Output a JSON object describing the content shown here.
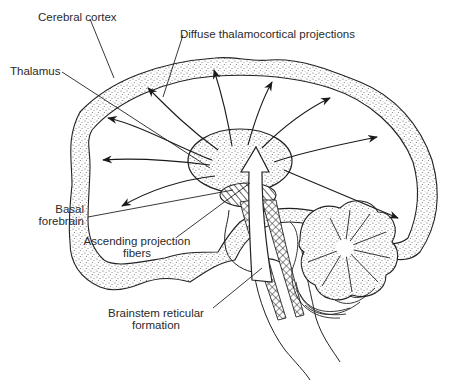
{
  "diagram": {
    "colors": {
      "line": "#1a1a1a",
      "stipple": "#555555",
      "background": "#ffffff",
      "text": "#2a2a2a"
    },
    "labels": {
      "cerebral_cortex": "Cerebral cortex",
      "diffuse_projections": "Diffuse thalamocortical projections",
      "thalamus": "Thalamus",
      "basal_forebrain_1": "Basal",
      "basal_forebrain_2": "forebrain",
      "ascending_fibers_1": "Ascending projection",
      "ascending_fibers_2": "fibers",
      "brainstem_rf_1": "Brainstem reticular",
      "brainstem_rf_2": "formation"
    },
    "structures": [
      "cerebral-cortex",
      "thalamus",
      "basal-forebrain",
      "brainstem-reticular-formation",
      "cerebellum",
      "pons",
      "spinal-cord"
    ],
    "projection_arrow_count": 10
  }
}
